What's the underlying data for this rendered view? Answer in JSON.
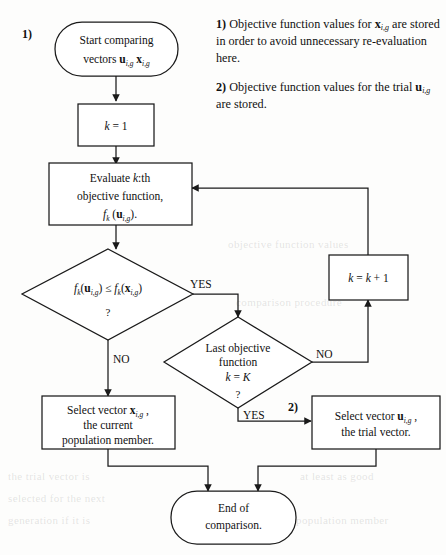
{
  "figure": {
    "type": "flowchart"
  },
  "markers": {
    "one": "1)",
    "two": "2)"
  },
  "notes": [
    {
      "lead": "1)",
      "text_before": " Objective function values for ",
      "var": "x",
      "var_sub": "i,g",
      "text_after": " are stored in order to avoid unnecessary re-evaluation here."
    },
    {
      "lead": "2)",
      "text_before": " Objective function values for the trial ",
      "var": "u",
      "var_sub": "i,g",
      "text_after": " are stored."
    }
  ],
  "nodes": {
    "start": {
      "shape": "terminator",
      "line1": "Start comparing",
      "line2_prefix": "vectors ",
      "line2_var1": "u",
      "line2_sub1": "i,g",
      "line2_var2": "x",
      "line2_sub2": "i,g"
    },
    "init": {
      "shape": "process",
      "text_var": "k",
      "text_rest": " = 1"
    },
    "evaluate": {
      "shape": "process",
      "line1_prefix": "Evaluate ",
      "line1_var": "k",
      "line1_suffix": ":th",
      "line2": "objective function,",
      "line3_f": "f",
      "line3_fsub": "k",
      "line3_mid": " (",
      "line3_var": "u",
      "line3_vsub": "i,g",
      "line3_end": ")."
    },
    "compare": {
      "shape": "decision",
      "f1": "f",
      "f1sub": "k",
      "p1": "(",
      "v1": "u",
      "v1sub": "i,g",
      "p2": ") ≤ ",
      "f2": "f",
      "f2sub": "k",
      "p3": "(",
      "v2": "x",
      "v2sub": "i,g",
      "p4": ")",
      "question": "?"
    },
    "last_objective": {
      "shape": "decision",
      "line1": "Last objective",
      "line2": "function",
      "line3_var": "k",
      "line3_rest": " = ",
      "line3_var2": "K",
      "question": "?"
    },
    "increment": {
      "shape": "process",
      "var1": "k",
      "mid": " = ",
      "var2": "k",
      "rest": " + 1"
    },
    "select_x": {
      "shape": "process",
      "line1_prefix": "Select vector ",
      "line1_var": "x",
      "line1_sub": "i,g",
      "line1_suffix": " ,",
      "line2": "the current",
      "line3": "population member."
    },
    "select_u": {
      "shape": "process",
      "line1_prefix": "Select vector ",
      "line1_var": "u",
      "line1_sub": "i,g",
      "line1_suffix": " ,",
      "line2": "the trial vector."
    },
    "end": {
      "shape": "terminator",
      "line1": "End of",
      "line2": "comparison."
    }
  },
  "edge_labels": {
    "compare_yes": "YES",
    "compare_no": "NO",
    "last_no": "NO",
    "last_yes": "YES"
  },
  "colors": {
    "stroke": "#1a1a1a",
    "fill": "#ffffff",
    "page": "#fdfdfc",
    "text": "#111111"
  },
  "background_bleed": [
    "objective function values",
    "comparison procedure",
    "the trial vector is",
    "selected for the next",
    "generation if it is",
    "at least as good",
    "population member"
  ]
}
